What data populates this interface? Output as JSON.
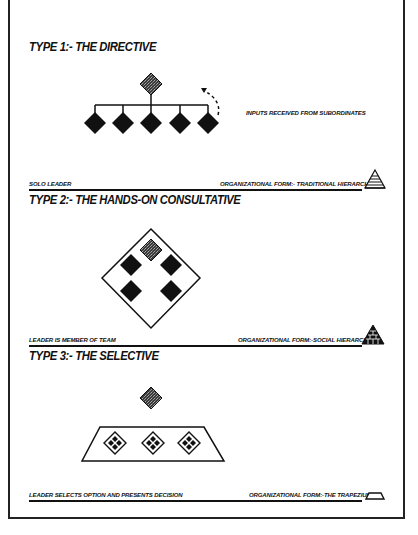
{
  "sections": [
    {
      "title": "TYPE 1:- THE DIRECTIVE",
      "annotation": "INPUTS RECEIVED FROM SUBORDINATES",
      "leader_caption": "SOLO LEADER",
      "form_caption": "ORGANIZATIONAL FORM:- TRADITIONAL HIERARCHY",
      "form_icon": "striped-pyramid-icon"
    },
    {
      "title": "TYPE 2:- THE HANDS-ON CONSULTATIVE",
      "leader_caption": "LEADER IS MEMBER OF TEAM",
      "form_caption": "ORGANIZATIONAL FORM:-SOCIAL HIERARCHY",
      "form_icon": "brick-pyramid-icon"
    },
    {
      "title": "TYPE 3:- THE SELECTIVE",
      "leader_caption": "LEADER SELECTS OPTION AND PRESENTS DECISION",
      "form_caption": "ORGANIZATIONAL FORM:-THE TRAPEZIUM",
      "form_icon": "trapezium-icon"
    }
  ],
  "colors": {
    "ink": "#111111",
    "leader_fill": "#555555",
    "background": "#ffffff"
  }
}
